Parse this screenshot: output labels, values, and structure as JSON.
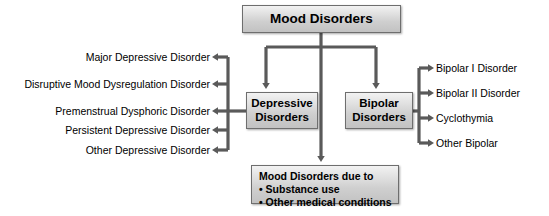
{
  "diagram": {
    "title": "Mood Disorders",
    "root": {
      "label": "Mood Disorders"
    },
    "branches": [
      {
        "label": "Depressive Disorders",
        "line1": "Depressive",
        "line2": "Disorders",
        "children": [
          "Major Depressive Disorder",
          "Disruptive Mood Dysregulation Disorder",
          "Premenstrual Dysphoric Disorder",
          "Persistent Depressive Disorder",
          "Other Depressive Disorder"
        ]
      },
      {
        "label": "Bipolar Disorders",
        "line1": "Bipolar",
        "line2": "Disorders",
        "children": [
          "Bipolar I Disorder",
          "Bipolar II Disorder",
          "Cyclothymia",
          "Other Bipolar"
        ]
      }
    ],
    "secondary": {
      "heading": "Mood Disorders due to",
      "bullets": [
        "• Substance use",
        "• Other medical conditions"
      ]
    },
    "colors": {
      "connector": "#5a5a5a",
      "box_border": "#6e6e6e",
      "box_fill_top": "#f2f2f2",
      "box_fill_bottom": "#c2c2c2",
      "text": "#000000",
      "background": "#ffffff"
    }
  }
}
